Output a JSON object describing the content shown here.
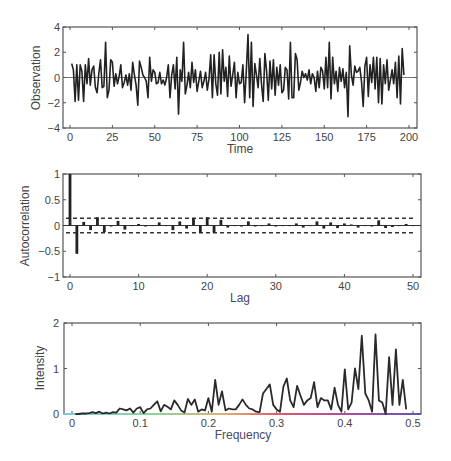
{
  "figure": {
    "panels": [
      {
        "id": "observation",
        "ylabel": "Observation",
        "xlabel": "Time"
      },
      {
        "id": "acf",
        "ylabel": "Autocorrelation",
        "xlabel": "Lag"
      },
      {
        "id": "periodogram",
        "ylabel": "Intensity",
        "xlabel": "Frequency"
      }
    ]
  },
  "chart_data": [
    {
      "type": "line",
      "title": "",
      "xlabel": "Time",
      "ylabel": "Observation",
      "xlim": [
        0,
        200
      ],
      "ylim": [
        -4,
        4
      ],
      "xticks": [
        0,
        25,
        50,
        75,
        100,
        125,
        150,
        175,
        200
      ],
      "yticks": [
        -4,
        -2,
        0,
        2,
        4
      ],
      "grid": false,
      "reference_line": 0,
      "x": [
        1,
        2,
        3,
        4,
        5,
        6,
        7,
        8,
        9,
        10,
        11,
        12,
        13,
        14,
        15,
        16,
        17,
        18,
        19,
        20,
        21,
        22,
        23,
        24,
        25,
        26,
        27,
        28,
        29,
        30,
        31,
        32,
        33,
        34,
        35,
        36,
        37,
        38,
        39,
        40,
        41,
        42,
        43,
        44,
        45,
        46,
        47,
        48,
        49,
        50,
        51,
        52,
        53,
        54,
        55,
        56,
        57,
        58,
        59,
        60,
        61,
        62,
        63,
        64,
        65,
        66,
        67,
        68,
        69,
        70,
        71,
        72,
        73,
        74,
        75,
        76,
        77,
        78,
        79,
        80,
        81,
        82,
        83,
        84,
        85,
        86,
        87,
        88,
        89,
        90,
        91,
        92,
        93,
        94,
        95,
        96,
        97,
        98,
        99,
        100,
        101,
        102,
        103,
        104,
        105,
        106,
        107,
        108,
        109,
        110,
        111,
        112,
        113,
        114,
        115,
        116,
        117,
        118,
        119,
        120,
        121,
        122,
        123,
        124,
        125,
        126,
        127,
        128,
        129,
        130,
        131,
        132,
        133,
        134,
        135,
        136,
        137,
        138,
        139,
        140,
        141,
        142,
        143,
        144,
        145,
        146,
        147,
        148,
        149,
        150,
        151,
        152,
        153,
        154,
        155,
        156,
        157,
        158,
        159,
        160,
        161,
        162,
        163,
        164,
        165,
        166,
        167,
        168,
        169,
        170,
        171,
        172,
        173,
        174,
        175,
        176,
        177,
        178,
        179,
        180,
        181,
        182,
        183,
        184,
        185,
        186,
        187,
        188,
        189,
        190,
        191,
        192,
        193,
        194,
        195,
        196,
        197,
        198,
        199,
        200
      ],
      "values": [
        1.1,
        0.6,
        -1.9,
        1.0,
        -1.8,
        1.0,
        0.5,
        -1.9,
        1.0,
        -0.5,
        1.5,
        -0.6,
        0.6,
        0.9,
        -0.8,
        -1.2,
        0.3,
        1.4,
        -0.8,
        -0.7,
        2.8,
        -1.6,
        -1.0,
        1.4,
        1.2,
        -0.7,
        0.3,
        -0.5,
        0.1,
        1.0,
        -0.8,
        -0.4,
        0.2,
        -0.6,
        0.3,
        -1.0,
        1.2,
        0.2,
        -0.6,
        -2.2,
        1.3,
        0.8,
        0.2,
        0.0,
        -0.3,
        -1.6,
        1.6,
        -0.3,
        0.6,
        0.4,
        -0.5,
        -0.4,
        0.4,
        -0.5,
        -0.2,
        -0.6,
        0.0,
        1.0,
        -1.6,
        0.2,
        1.0,
        -0.9,
        1.6,
        -2.9,
        0.6,
        -0.3,
        2.8,
        -1.3,
        -0.6,
        0.4,
        -0.8,
        1.2,
        -0.4,
        0.6,
        -1.1,
        -0.3,
        0.5,
        -0.8,
        -0.3,
        0.4,
        -1.0,
        -0.1,
        1.8,
        -1.6,
        1.8,
        -0.5,
        -1.4,
        2.0,
        -1.3,
        2.2,
        -0.3,
        0.8,
        -1.5,
        1.7,
        -0.7,
        0.2,
        1.2,
        -1.6,
        0.4,
        -0.5,
        -0.4,
        1.0,
        -2.0,
        0.5,
        3.4,
        -1.6,
        2.8,
        -2.3,
        1.1,
        0.2,
        -0.8,
        1.5,
        -0.5,
        -1.9,
        1.9,
        0.5,
        -1.8,
        1.3,
        -0.9,
        1.4,
        -1.4,
        0.8,
        -0.6,
        1.0,
        -1.2,
        -1.0,
        0.8,
        0.6,
        -1.7,
        2.8,
        -1.6,
        -1.6,
        1.9,
        1.4,
        -1.0,
        -0.4,
        0.5,
        0.0,
        0.3,
        -0.2,
        0.6,
        -0.5,
        0.3,
        0.0,
        -1.1,
        0.5,
        -0.8,
        0.8,
        0.5,
        -0.9,
        1.6,
        -0.8,
        2.8,
        -1.7,
        1.6,
        -0.5,
        0.5,
        -1.1,
        0.8,
        -0.3,
        0.7,
        -0.8,
        0.4,
        -3.1,
        2.5,
        0.2,
        -0.6,
        0.9,
        0.4,
        0.5,
        0.8,
        -0.3,
        -2.3,
        0.9,
        1.6,
        -1.5,
        1.0,
        -0.4,
        1.6,
        -0.9,
        1.6,
        -2.0,
        1.5,
        -2.1,
        1.0,
        -0.5,
        1.4,
        -1.0,
        -0.2,
        0.6,
        -0.5,
        1.2,
        -1.6,
        1.7,
        -2.1,
        2.3,
        0.2
      ]
    },
    {
      "type": "bar",
      "title": "",
      "xlabel": "Lag",
      "ylabel": "Autocorrelation",
      "xlim": [
        0,
        50
      ],
      "ylim": [
        -1,
        1
      ],
      "xticks": [
        0,
        10,
        20,
        30,
        40,
        50
      ],
      "yticks": [
        -1,
        -0.5,
        0,
        0.5,
        1
      ],
      "confidence_bounds": [
        -0.14,
        0.14
      ],
      "grid": false,
      "categories": [
        0,
        1,
        2,
        3,
        4,
        5,
        6,
        7,
        8,
        9,
        10,
        11,
        12,
        13,
        14,
        15,
        16,
        17,
        18,
        19,
        20,
        21,
        22,
        23,
        24,
        25,
        26,
        27,
        28,
        29,
        30,
        31,
        32,
        33,
        34,
        35,
        36,
        37,
        38,
        39,
        40,
        41,
        42,
        43,
        44,
        45,
        46,
        47,
        48,
        49,
        50
      ],
      "values": [
        1.0,
        -0.55,
        0.07,
        -0.09,
        0.16,
        -0.13,
        -0.02,
        0.09,
        -0.08,
        0.0,
        0.03,
        -0.02,
        0.0,
        0.06,
        0.0,
        -0.09,
        0.08,
        -0.06,
        0.14,
        -0.14,
        0.16,
        -0.14,
        0.11,
        -0.04,
        0.0,
        -0.02,
        0.08,
        -0.02,
        0.0,
        0.04,
        -0.02,
        0.0,
        0.0,
        0.04,
        -0.04,
        0.0,
        0.08,
        -0.06,
        0.06,
        -0.05,
        0.04,
        0.02,
        -0.04,
        0.0,
        -0.02,
        0.1,
        -0.05,
        -0.03,
        0.0,
        0.03,
        0.0
      ]
    },
    {
      "type": "line",
      "title": "",
      "xlabel": "Frequency",
      "ylabel": "Intensity",
      "xlim": [
        0,
        0.5
      ],
      "ylim": [
        0,
        2
      ],
      "xticks": [
        0,
        0.1,
        0.2,
        0.3,
        0.4,
        0.5
      ],
      "yticks": [
        0,
        1,
        2
      ],
      "grid": false,
      "x": [
        0.005,
        0.01,
        0.015,
        0.02,
        0.025,
        0.03,
        0.035,
        0.04,
        0.045,
        0.05,
        0.055,
        0.06,
        0.065,
        0.07,
        0.075,
        0.08,
        0.085,
        0.09,
        0.095,
        0.1,
        0.105,
        0.11,
        0.115,
        0.12,
        0.125,
        0.13,
        0.135,
        0.14,
        0.145,
        0.15,
        0.155,
        0.16,
        0.165,
        0.17,
        0.175,
        0.18,
        0.185,
        0.19,
        0.195,
        0.2,
        0.205,
        0.21,
        0.215,
        0.22,
        0.225,
        0.23,
        0.235,
        0.24,
        0.245,
        0.25,
        0.255,
        0.26,
        0.265,
        0.27,
        0.275,
        0.28,
        0.285,
        0.29,
        0.295,
        0.3,
        0.305,
        0.31,
        0.315,
        0.32,
        0.325,
        0.33,
        0.335,
        0.34,
        0.345,
        0.35,
        0.355,
        0.36,
        0.365,
        0.37,
        0.375,
        0.38,
        0.385,
        0.39,
        0.395,
        0.4,
        0.405,
        0.41,
        0.415,
        0.42,
        0.425,
        0.43,
        0.435,
        0.44,
        0.445,
        0.45,
        0.455,
        0.46,
        0.465,
        0.47,
        0.475,
        0.48,
        0.485,
        0.49,
        0.495,
        0.5
      ],
      "values": [
        0.0,
        0.0,
        0.01,
        0.01,
        0.02,
        0.04,
        0.02,
        0.05,
        0.01,
        0.03,
        0.01,
        0.04,
        0.03,
        0.12,
        0.1,
        0.08,
        0.12,
        0.03,
        0.12,
        0.15,
        0.02,
        0.1,
        0.12,
        0.2,
        0.28,
        0.06,
        0.2,
        0.16,
        0.1,
        0.3,
        0.2,
        0.08,
        0.03,
        0.33,
        0.2,
        0.32,
        0.05,
        0.1,
        0.08,
        0.35,
        0.05,
        0.75,
        0.2,
        0.5,
        0.08,
        0.12,
        0.1,
        0.1,
        0.2,
        0.32,
        0.2,
        0.12,
        0.1,
        0.05,
        0.04,
        0.45,
        0.55,
        0.65,
        0.2,
        0.1,
        0.05,
        0.6,
        0.78,
        0.3,
        0.15,
        0.62,
        0.4,
        0.2,
        0.3,
        0.35,
        0.7,
        0.15,
        0.35,
        0.3,
        0.3,
        0.1,
        0.58,
        0.2,
        0.05,
        0.98,
        0.1,
        0.25,
        1.0,
        0.55,
        1.72,
        0.45,
        0.3,
        0.05,
        1.75,
        0.3,
        0.25,
        0.0,
        1.25,
        0.2,
        1.42,
        0.2,
        0.75,
        0.1
      ]
    }
  ]
}
